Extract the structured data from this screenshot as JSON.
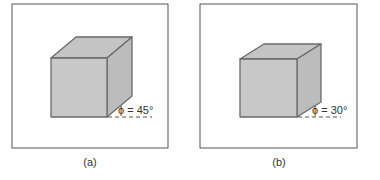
{
  "panels": [
    {
      "id": "a",
      "caption": "(a)",
      "angle_label": "ϕ = 45°",
      "angle_deg": 45
    },
    {
      "id": "b",
      "caption": "(b)",
      "angle_label": "ϕ = 30°",
      "angle_deg": 30
    }
  ],
  "colors": {
    "cube_fill": "#c8c8c8",
    "cube_side": "#bdbdbd",
    "cube_top": "#c2c2c2",
    "edge": "#6a6a6a",
    "frame": "#555555"
  }
}
